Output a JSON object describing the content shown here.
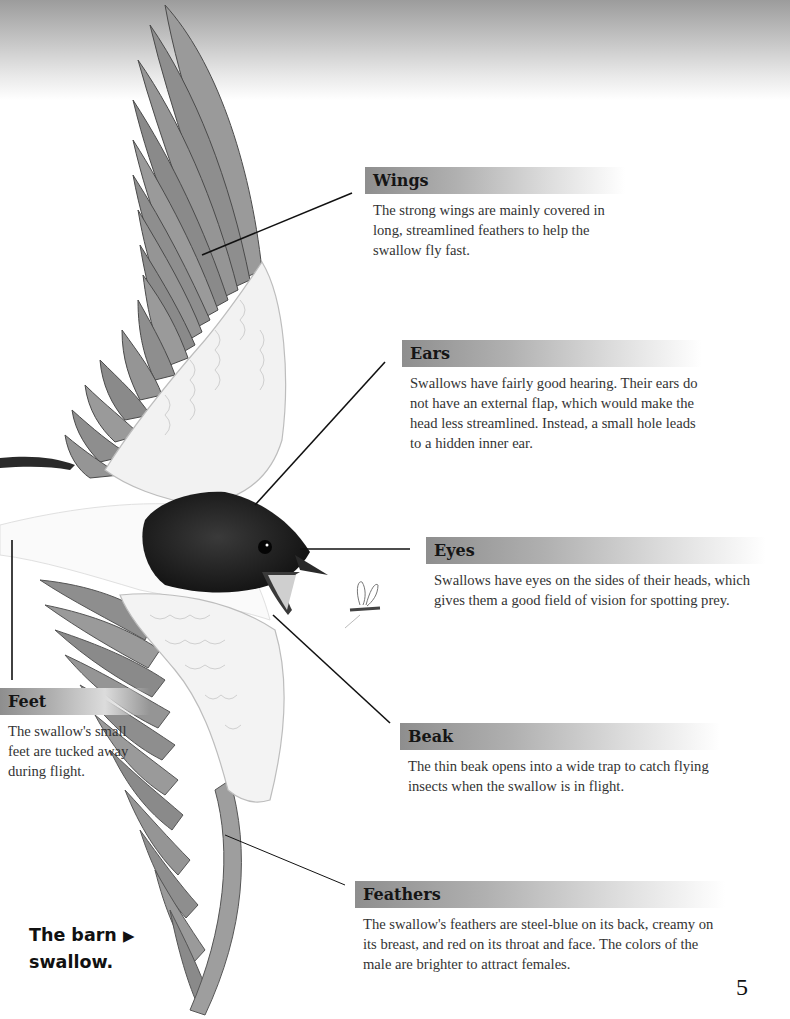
{
  "page": {
    "page_number": "5",
    "caption": {
      "line1": "The barn",
      "arrow_icon": "▶",
      "line2": "swallow."
    }
  },
  "callouts": [
    {
      "id": "wings",
      "title": "Wings",
      "text": "The strong wings are mainly covered in long, streamlined feathers to help the swallow fly fast."
    },
    {
      "id": "ears",
      "title": "Ears",
      "text": "Swallows have fairly good hearing. Their ears do not have an external flap, which would make the head less streamlined. Instead, a small hole leads to a hidden inner ear."
    },
    {
      "id": "eyes",
      "title": "Eyes",
      "text": "Swallows have eyes on the sides of their heads, which gives them a good field of vision for spotting prey."
    },
    {
      "id": "feet",
      "title": "Feet",
      "text": "The swallow's small feet are tucked away during flight."
    },
    {
      "id": "beak",
      "title": "Beak",
      "text": "The thin beak opens into a wide trap to catch flying insects when the swallow is in flight."
    },
    {
      "id": "feathers",
      "title": "Feathers",
      "text": "The swallow's feathers are steel-blue on its back, creamy on its breast, and red on its throat and face. The colors of the male are brighter to attract females."
    }
  ],
  "illustration": {
    "subject": "barn swallow in flight",
    "extra": "small flying insect (prey) in front of beak"
  },
  "colors": {
    "header_bar_start": "#8e8e8e",
    "header_bar_end": "#ffffff",
    "leader_line": "#111111",
    "text": "#333333"
  }
}
